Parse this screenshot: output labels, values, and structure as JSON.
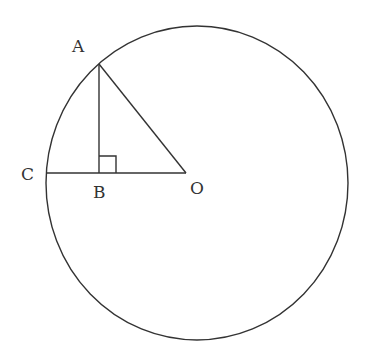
{
  "diagram": {
    "type": "geometry",
    "colors": {
      "stroke": "#333333",
      "background": "#ffffff"
    },
    "circle": {
      "cx": 197,
      "cy": 183,
      "rx": 151,
      "ry": 157
    },
    "points": {
      "A": {
        "label": "A",
        "x": 99,
        "y": 64,
        "label_x": 72,
        "label_y": 52
      },
      "B": {
        "label": "B",
        "x": 99,
        "y": 173,
        "label_x": 93,
        "label_y": 198
      },
      "C": {
        "label": "C",
        "x": 46,
        "y": 173,
        "label_x": 21,
        "label_y": 180
      },
      "O": {
        "label": "O",
        "x": 186,
        "y": 173,
        "label_x": 190,
        "label_y": 194
      }
    },
    "segments": [
      {
        "from": "A",
        "to": "B"
      },
      {
        "from": "A",
        "to": "O"
      },
      {
        "from": "C",
        "to": "O"
      }
    ],
    "right_angle_marker": {
      "at": "B",
      "size": 17
    }
  }
}
